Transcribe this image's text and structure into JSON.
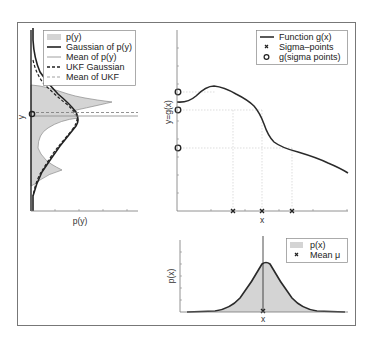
{
  "figure": {
    "frame_color": "#777777"
  },
  "left_panel": {
    "xlabel": "p(y)",
    "ylabel": "y",
    "legend": [
      {
        "label": "p(y)",
        "style": "gray-fill"
      },
      {
        "label": "Gaussian of p(y)",
        "style": "thick-solid"
      },
      {
        "label": "Mean of p(y)",
        "style": "thin-solid"
      },
      {
        "label": "UKF Gaussian",
        "style": "thick-dashed"
      },
      {
        "label": "Mean of UKF",
        "style": "thin-dashed"
      }
    ]
  },
  "middle_panel": {
    "xlabel": "x",
    "ylabel": "y=g(x)",
    "legend": [
      {
        "label": "Function g(x)",
        "style": "solid-line"
      },
      {
        "label": "Sigma–points",
        "style": "x-marker"
      },
      {
        "label": "g(sigma points)",
        "style": "o-marker"
      }
    ]
  },
  "bottom_panel": {
    "xlabel": "x",
    "ylabel": "p(x)",
    "legend": [
      {
        "label": "p(x)",
        "style": "gray-fill"
      },
      {
        "label": "Mean μ",
        "style": "x-marker"
      }
    ]
  },
  "colors": {
    "fill": "#d4d4d4",
    "line": "#2a2a2a",
    "axis": "#777777",
    "grid": "#c8c8c8"
  }
}
